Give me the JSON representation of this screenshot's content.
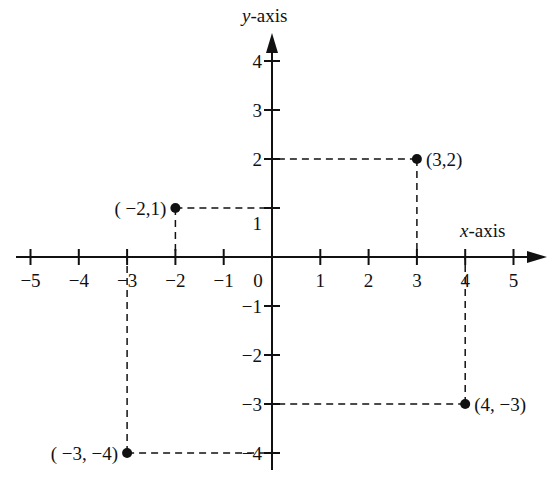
{
  "axes": {
    "x_label_var": "x",
    "x_label_rest": "-axis",
    "y_label_var": "y",
    "y_label_rest": "-axis",
    "x_ticks": [
      -5,
      -4,
      -3,
      -2,
      -1,
      1,
      2,
      3,
      4,
      5
    ],
    "y_ticks": [
      -4,
      -3,
      -2,
      -1,
      1,
      2,
      3,
      4
    ],
    "origin_label": "0",
    "x_range": [
      -5,
      5
    ],
    "y_range": [
      -4,
      4
    ]
  },
  "points": [
    {
      "x": 3,
      "y": 2,
      "label": "(3,2)"
    },
    {
      "x": -2,
      "y": 1,
      "label": "( −2,1)"
    },
    {
      "x": 4,
      "y": -3,
      "label": "(4, −3)"
    },
    {
      "x": -3,
      "y": -4,
      "label": "( −3,  −4)"
    }
  ],
  "colors": {
    "ink": "#111111",
    "background": "#ffffff"
  }
}
